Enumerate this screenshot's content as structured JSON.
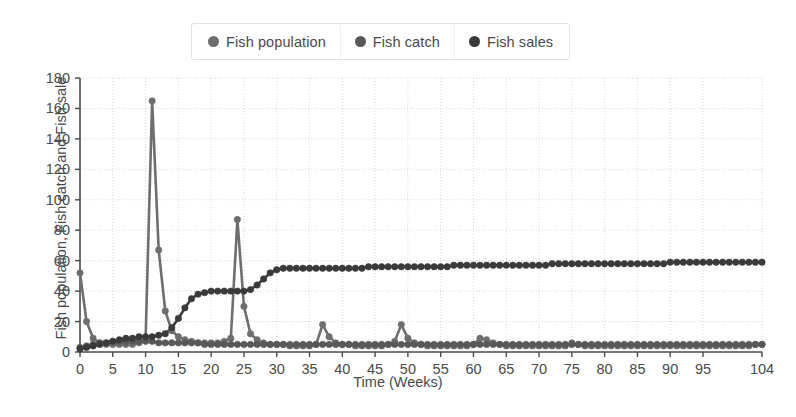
{
  "legend": {
    "position": "top-center",
    "items": [
      {
        "label": "Fish population",
        "color": "#6e6e6e",
        "marker": "circle-marker-icon"
      },
      {
        "label": "Fish catch",
        "color": "#585858",
        "marker": "circle-marker-icon"
      },
      {
        "label": "Fish sales",
        "color": "#3a3a3a",
        "marker": "circle-marker-icon"
      }
    ]
  },
  "chart_data": {
    "type": "line",
    "title": "",
    "xlabel": "Time (Weeks)",
    "ylabel": "Fish population, Fish catch and Fish sales",
    "ylabel_clipped": "Fish population, Fish catch and Fish sale",
    "xlim": [
      0,
      104
    ],
    "ylim": [
      0,
      180
    ],
    "yticks": [
      0,
      20,
      40,
      60,
      80,
      100,
      120,
      140,
      160,
      180
    ],
    "xticks": [
      0,
      5,
      10,
      15,
      20,
      25,
      30,
      35,
      40,
      45,
      50,
      55,
      60,
      65,
      70,
      75,
      80,
      85,
      90,
      95,
      104
    ],
    "grid": true,
    "grid_color": "#d9d9d9",
    "grid_style": "dotted",
    "axis_color": "#4a4a4a",
    "background": "#ffffff",
    "x": [
      0,
      1,
      2,
      3,
      4,
      5,
      6,
      7,
      8,
      9,
      10,
      11,
      12,
      13,
      14,
      15,
      16,
      17,
      18,
      19,
      20,
      21,
      22,
      23,
      24,
      25,
      26,
      27,
      28,
      29,
      30,
      31,
      32,
      33,
      34,
      35,
      36,
      37,
      38,
      39,
      40,
      41,
      42,
      43,
      44,
      45,
      46,
      47,
      48,
      49,
      50,
      51,
      52,
      53,
      54,
      55,
      56,
      57,
      58,
      59,
      60,
      61,
      62,
      63,
      64,
      65,
      66,
      67,
      68,
      69,
      70,
      71,
      72,
      73,
      74,
      75,
      76,
      77,
      78,
      79,
      80,
      81,
      82,
      83,
      84,
      85,
      86,
      87,
      88,
      89,
      90,
      91,
      92,
      93,
      94,
      95,
      96,
      97,
      98,
      99,
      100,
      101,
      102,
      103,
      104
    ],
    "series": [
      {
        "name": "Fish population",
        "color": "#6e6e6e",
        "marker": "circle",
        "values": [
          52,
          20,
          9,
          6,
          5,
          5,
          5,
          5,
          5,
          6,
          8,
          165,
          67,
          27,
          14,
          10,
          8,
          7,
          6,
          6,
          6,
          6,
          7,
          9,
          87,
          30,
          12,
          8,
          6,
          5,
          5,
          5,
          4,
          4,
          4,
          4,
          5,
          18,
          10,
          6,
          5,
          5,
          4,
          4,
          4,
          4,
          4,
          5,
          7,
          18,
          9,
          6,
          5,
          4,
          4,
          4,
          4,
          4,
          4,
          4,
          5,
          9,
          8,
          6,
          5,
          4,
          4,
          4,
          4,
          4,
          4,
          4,
          4,
          4,
          4,
          6,
          5,
          4,
          4,
          4,
          4,
          4,
          4,
          4,
          4,
          4,
          4,
          4,
          4,
          4,
          4,
          4,
          4,
          4,
          4,
          4,
          4,
          4,
          4,
          4,
          4,
          4,
          4,
          5,
          5
        ]
      },
      {
        "name": "Fish catch",
        "color": "#585858",
        "marker": "circle",
        "values": [
          3,
          4,
          5,
          6,
          6,
          7,
          7,
          7,
          7,
          7,
          7,
          7,
          6,
          6,
          6,
          6,
          6,
          6,
          6,
          5,
          5,
          5,
          5,
          5,
          5,
          5,
          5,
          5,
          5,
          5,
          5,
          5,
          5,
          5,
          5,
          5,
          5,
          5,
          5,
          5,
          5,
          5,
          5,
          5,
          5,
          5,
          5,
          5,
          5,
          5,
          5,
          5,
          5,
          5,
          5,
          5,
          5,
          5,
          5,
          5,
          5,
          5,
          5,
          5,
          5,
          5,
          5,
          5,
          5,
          5,
          5,
          5,
          5,
          5,
          5,
          5,
          5,
          5,
          5,
          5,
          5,
          5,
          5,
          5,
          5,
          5,
          5,
          5,
          5,
          5,
          5,
          5,
          5,
          5,
          5,
          5,
          5,
          5,
          5,
          5,
          5,
          5,
          5,
          5,
          5
        ]
      },
      {
        "name": "Fish sales",
        "color": "#3a3a3a",
        "marker": "circle",
        "values": [
          2,
          3,
          4,
          5,
          6,
          7,
          8,
          9,
          9,
          10,
          10,
          10,
          11,
          12,
          16,
          22,
          29,
          35,
          38,
          39,
          40,
          40,
          40,
          40,
          40,
          40,
          41,
          44,
          48,
          52,
          54,
          55,
          55,
          55,
          55,
          55,
          55,
          55,
          55,
          55,
          55,
          55,
          55,
          55,
          56,
          56,
          56,
          56,
          56,
          56,
          56,
          56,
          56,
          56,
          56,
          56,
          56,
          57,
          57,
          57,
          57,
          57,
          57,
          57,
          57,
          57,
          57,
          57,
          57,
          57,
          57,
          57,
          58,
          58,
          58,
          58,
          58,
          58,
          58,
          58,
          58,
          58,
          58,
          58,
          58,
          58,
          58,
          58,
          58,
          58,
          59,
          59,
          59,
          59,
          59,
          59,
          59,
          59,
          59,
          59,
          59,
          59,
          59,
          59,
          59
        ]
      }
    ],
    "annotations": [
      {
        "text": "peak spike",
        "x": 11,
        "y": 165
      },
      {
        "text": "second spike",
        "x": 24,
        "y": 87
      },
      {
        "text": "minor spike",
        "x": 37,
        "y": 18
      },
      {
        "text": "minor spike",
        "x": 49,
        "y": 18
      },
      {
        "text": "minor spike",
        "x": 62,
        "y": 8
      }
    ]
  }
}
